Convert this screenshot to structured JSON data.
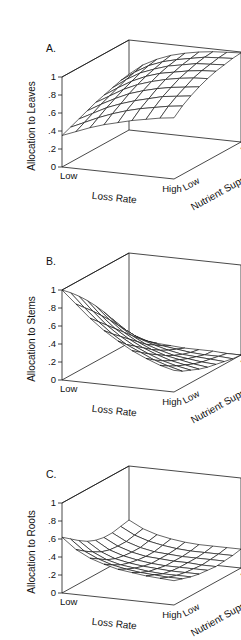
{
  "figure": {
    "background": "#ffffff",
    "ink": "#111111",
    "panel_count": 3
  },
  "chart_data": [
    {
      "type": "surface3d",
      "panel": "A",
      "panel_letter": "A.",
      "title": "",
      "zlabel": "Allocation to Leaves",
      "xlabel": "Loss Rate",
      "ylabel": "Nutrient Supply Rate",
      "zticks": [
        "1",
        ".8",
        ".6",
        ".4",
        ".2",
        "0"
      ],
      "ztick_values": [
        1,
        0.8,
        0.6,
        0.4,
        0.2,
        0
      ],
      "zlim": [
        0,
        1
      ],
      "x_categories": [
        "Low",
        "High"
      ],
      "y_categories": [
        "Low",
        "High"
      ],
      "grid": false,
      "nx": 9,
      "ny": 9,
      "z": [
        [
          0.35,
          0.41,
          0.47,
          0.52,
          0.56,
          0.6,
          0.63,
          0.66,
          0.68
        ],
        [
          0.39,
          0.46,
          0.53,
          0.59,
          0.64,
          0.68,
          0.71,
          0.74,
          0.76
        ],
        [
          0.43,
          0.51,
          0.59,
          0.65,
          0.7,
          0.74,
          0.78,
          0.8,
          0.82
        ],
        [
          0.47,
          0.56,
          0.64,
          0.71,
          0.76,
          0.8,
          0.83,
          0.85,
          0.87
        ],
        [
          0.51,
          0.6,
          0.69,
          0.76,
          0.81,
          0.85,
          0.88,
          0.9,
          0.91
        ],
        [
          0.54,
          0.64,
          0.73,
          0.8,
          0.85,
          0.88,
          0.91,
          0.93,
          0.94
        ],
        [
          0.57,
          0.68,
          0.77,
          0.83,
          0.88,
          0.91,
          0.94,
          0.95,
          0.96
        ],
        [
          0.6,
          0.71,
          0.8,
          0.86,
          0.9,
          0.93,
          0.96,
          0.97,
          0.98
        ],
        [
          0.62,
          0.74,
          0.82,
          0.88,
          0.92,
          0.95,
          0.97,
          0.98,
          0.99
        ]
      ]
    },
    {
      "type": "surface3d",
      "panel": "B",
      "panel_letter": "B.",
      "title": "",
      "zlabel": "Allocation to Stems",
      "xlabel": "Loss Rate",
      "ylabel": "Nutrient Supply Rate",
      "zticks": [
        "1",
        ".8",
        ".6",
        ".4",
        ".2",
        "0"
      ],
      "ztick_values": [
        1,
        0.8,
        0.6,
        0.4,
        0.2,
        0
      ],
      "zlim": [
        0,
        1
      ],
      "x_categories": [
        "Low",
        "High"
      ],
      "y_categories": [
        "Low",
        "High"
      ],
      "grid": false,
      "nx": 9,
      "ny": 9,
      "z": [
        [
          1.0,
          0.86,
          0.72,
          0.6,
          0.5,
          0.41,
          0.34,
          0.28,
          0.24
        ],
        [
          0.92,
          0.77,
          0.63,
          0.51,
          0.41,
          0.34,
          0.27,
          0.22,
          0.18
        ],
        [
          0.83,
          0.68,
          0.54,
          0.43,
          0.34,
          0.27,
          0.21,
          0.17,
          0.14
        ],
        [
          0.73,
          0.58,
          0.45,
          0.35,
          0.27,
          0.21,
          0.16,
          0.13,
          0.1
        ],
        [
          0.62,
          0.48,
          0.36,
          0.27,
          0.2,
          0.15,
          0.12,
          0.09,
          0.07
        ],
        [
          0.5,
          0.37,
          0.27,
          0.19,
          0.14,
          0.1,
          0.08,
          0.06,
          0.05
        ],
        [
          0.37,
          0.26,
          0.18,
          0.13,
          0.09,
          0.06,
          0.05,
          0.04,
          0.03
        ],
        [
          0.23,
          0.15,
          0.1,
          0.07,
          0.05,
          0.03,
          0.02,
          0.02,
          0.01
        ],
        [
          0.08,
          0.05,
          0.03,
          0.02,
          0.01,
          0.01,
          0.01,
          0.0,
          0.0
        ]
      ]
    },
    {
      "type": "surface3d",
      "panel": "C",
      "panel_letter": "C.",
      "title": "",
      "zlabel": "Allocation to Roots",
      "xlabel": "Loss Rate",
      "ylabel": "Nutrient Supply Rate",
      "zticks": [
        "1",
        ".8",
        ".6",
        ".4",
        ".2",
        "0"
      ],
      "ztick_values": [
        1,
        0.8,
        0.6,
        0.4,
        0.2,
        0
      ],
      "zlim": [
        0,
        1
      ],
      "x_categories": [
        "Low",
        "High"
      ],
      "y_categories": [
        "Low",
        "High"
      ],
      "grid": false,
      "nx": 9,
      "ny": 9,
      "z": [
        [
          0.62,
          0.5,
          0.42,
          0.37,
          0.33,
          0.31,
          0.29,
          0.28,
          0.27
        ],
        [
          0.55,
          0.43,
          0.36,
          0.31,
          0.28,
          0.26,
          0.25,
          0.24,
          0.24
        ],
        [
          0.48,
          0.37,
          0.3,
          0.26,
          0.24,
          0.22,
          0.21,
          0.21,
          0.21
        ],
        [
          0.42,
          0.32,
          0.26,
          0.23,
          0.21,
          0.2,
          0.19,
          0.19,
          0.19
        ],
        [
          0.38,
          0.29,
          0.24,
          0.21,
          0.19,
          0.18,
          0.18,
          0.18,
          0.18
        ],
        [
          0.36,
          0.28,
          0.23,
          0.2,
          0.19,
          0.18,
          0.18,
          0.17,
          0.17
        ],
        [
          0.36,
          0.28,
          0.23,
          0.2,
          0.19,
          0.18,
          0.18,
          0.18,
          0.18
        ],
        [
          0.38,
          0.3,
          0.25,
          0.22,
          0.2,
          0.19,
          0.19,
          0.19,
          0.19
        ],
        [
          0.4,
          0.32,
          0.27,
          0.24,
          0.22,
          0.21,
          0.21,
          0.21,
          0.21
        ]
      ]
    }
  ]
}
